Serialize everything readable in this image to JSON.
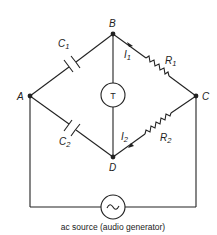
{
  "diagram": {
    "type": "bridge circuit",
    "nodes": [
      {
        "id": "A",
        "label": "A"
      },
      {
        "id": "B",
        "label": "B"
      },
      {
        "id": "C",
        "label": "C"
      },
      {
        "id": "D",
        "label": "D"
      }
    ],
    "components": {
      "c1": {
        "label": "C",
        "sub": "1",
        "kind": "capacitor",
        "between": "A-B"
      },
      "c2": {
        "label": "C",
        "sub": "2",
        "kind": "capacitor",
        "between": "A-D"
      },
      "r1": {
        "label": "R",
        "sub": "1",
        "kind": "resistor",
        "between": "B-C"
      },
      "r2": {
        "label": "R",
        "sub": "2",
        "kind": "resistor",
        "between": "D-C"
      },
      "detector": {
        "label": "T",
        "kind": "telephone/detector",
        "between": "B-D"
      },
      "source": {
        "symbol": "~",
        "kind": "ac source",
        "between": "A-C"
      }
    },
    "currents": {
      "i1": {
        "label": "I",
        "sub": "1"
      },
      "i2": {
        "label": "I",
        "sub": "2"
      }
    },
    "caption": "ac source (audio generator)"
  }
}
